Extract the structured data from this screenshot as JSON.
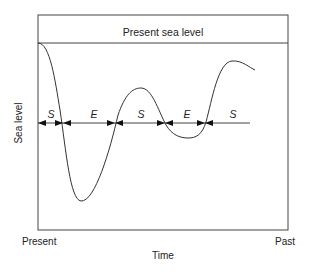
{
  "diagram": {
    "title": "Present sea level",
    "y_axis_label": "Sea level",
    "x_axis_label": "Time",
    "x_left_label": "Present",
    "x_right_label": "Past",
    "segments": [
      {
        "label": "S",
        "from_x": 38,
        "to_x": 63
      },
      {
        "label": "E",
        "from_x": 63,
        "to_x": 115
      },
      {
        "label": "S",
        "from_x": 115,
        "to_x": 165
      },
      {
        "label": "E",
        "from_x": 165,
        "to_x": 205
      },
      {
        "label": "S",
        "from_x": 205,
        "to_x": 250
      }
    ],
    "colors": {
      "line": "#333333",
      "text": "#222222",
      "background": "#ffffff"
    }
  }
}
